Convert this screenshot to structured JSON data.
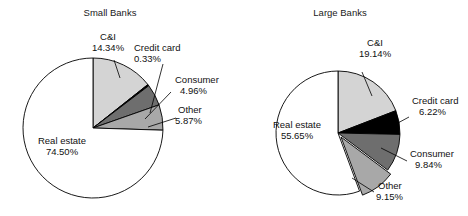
{
  "chart_data": [
    {
      "type": "pie",
      "title": "Small Banks",
      "id": "small-banks",
      "categories": [
        "C&I",
        "Credit card",
        "Consumer",
        "Other",
        "Real estate"
      ],
      "values": [
        14.34,
        0.33,
        4.96,
        5.87,
        74.5
      ],
      "value_labels": [
        "14.34%",
        "0.33%",
        "4.96%",
        "5.87%",
        "74.50%"
      ],
      "colors": [
        "#d4d4d4",
        "#000000",
        "#6e6e6e",
        "#a8a8a8",
        "#ffffff"
      ],
      "start_angle_deg": 0,
      "direction": "clockwise",
      "xlabel": "",
      "ylabel": "",
      "legend": "none",
      "grid": false
    },
    {
      "type": "pie",
      "title": "Large Banks",
      "id": "large-banks",
      "categories": [
        "C&I",
        "Credit card",
        "Consumer",
        "Other",
        "Real estate"
      ],
      "values": [
        19.14,
        6.22,
        9.84,
        9.15,
        55.65
      ],
      "value_labels": [
        "19.14%",
        "6.22%",
        "9.84%",
        "9.15%",
        "55.65%"
      ],
      "colors": [
        "#d4d4d4",
        "#000000",
        "#6e6e6e",
        "#a8a8a8",
        "#ffffff"
      ],
      "start_angle_deg": 0,
      "direction": "clockwise",
      "exploded": [
        "Other"
      ],
      "xlabel": "",
      "ylabel": "",
      "legend": "none",
      "grid": false
    }
  ],
  "left": {
    "title": "Small Banks",
    "ci_name": "C&I",
    "ci_value": "14.34%",
    "credit_name": "Credit card",
    "credit_value": "0.33%",
    "consumer_name": "Consumer",
    "consumer_value": "4.96%",
    "other_name": "Other",
    "other_value": "5.87%",
    "real_name": "Real estate",
    "real_value": "74.50%"
  },
  "right": {
    "title": "Large Banks",
    "ci_name": "C&I",
    "ci_value": "19.14%",
    "credit_name": "Credit card",
    "credit_value": "6.22%",
    "consumer_name": "Consumer",
    "consumer_value": "9.84%",
    "other_name": "Other",
    "other_value": "9.15%",
    "real_name": "Real estate",
    "real_value": "55.65%"
  }
}
